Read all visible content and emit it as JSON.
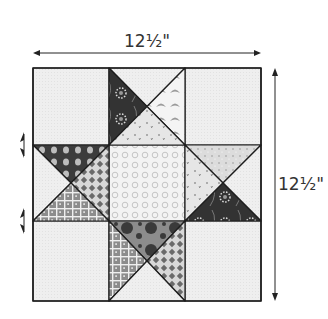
{
  "diagram": {
    "width_label": "12½\"",
    "height_label": "12½\"",
    "grid": {
      "rows": 3,
      "cols": 3
    },
    "colors": {
      "background": "#eeeeee",
      "outline": "#1e1e1e",
      "arrow": "#222222",
      "dark": "#3a3a3a",
      "medium": "#8a8a8a",
      "light": "#d9d9d9",
      "center": "#f0f0f0"
    },
    "cells": [
      {
        "position": "top-left",
        "type": "plain",
        "fabric": "background"
      },
      {
        "position": "top-center",
        "type": "quarter-square-triangles",
        "triangles": {
          "top": "background",
          "left": "dark-floral",
          "right": "light-scallop",
          "bottom": "light-floral"
        }
      },
      {
        "position": "top-right",
        "type": "plain",
        "fabric": "background"
      },
      {
        "position": "middle-left",
        "type": "quarter-square-triangles",
        "triangles": {
          "top": "dark-dots",
          "left": "background",
          "right": "diamond-lattice",
          "bottom": "gray-grid"
        }
      },
      {
        "position": "center",
        "type": "plain",
        "fabric": "light-circles"
      },
      {
        "position": "middle-right",
        "type": "quarter-square-triangles",
        "triangles": {
          "top": "light-speckle",
          "left": "light-floral",
          "right": "background",
          "bottom": "dark-floral"
        }
      },
      {
        "position": "bottom-left",
        "type": "plain",
        "fabric": "background"
      },
      {
        "position": "bottom-center",
        "type": "quarter-square-triangles",
        "triangles": {
          "top": "gray-big-dots",
          "left": "gray-grid",
          "right": "diamond-lattice",
          "bottom": "background"
        }
      },
      {
        "position": "bottom-right",
        "type": "plain",
        "fabric": "background"
      }
    ],
    "seam_arrows": [
      "row-1-2-seam",
      "row-2-3-seam"
    ]
  }
}
